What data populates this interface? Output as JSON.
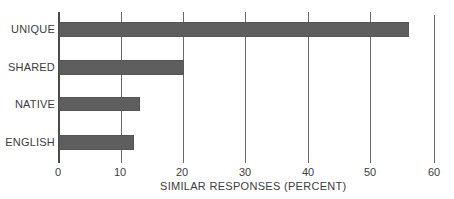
{
  "chart_data": {
    "type": "bar",
    "orientation": "horizontal",
    "title": "",
    "categories": [
      "UNIQUE",
      "SHARED",
      "NATIVE",
      "ENGLISH"
    ],
    "values": [
      56,
      20,
      13,
      12
    ],
    "xlabel": "SIMILAR RESPONSES (PERCENT)",
    "ylabel": "",
    "xlim": [
      0,
      60
    ],
    "xticks": [
      "0",
      "10",
      "20",
      "30",
      "40",
      "50",
      "60"
    ],
    "grid": true,
    "legend": null,
    "bar_color": "#5e5e5e"
  }
}
